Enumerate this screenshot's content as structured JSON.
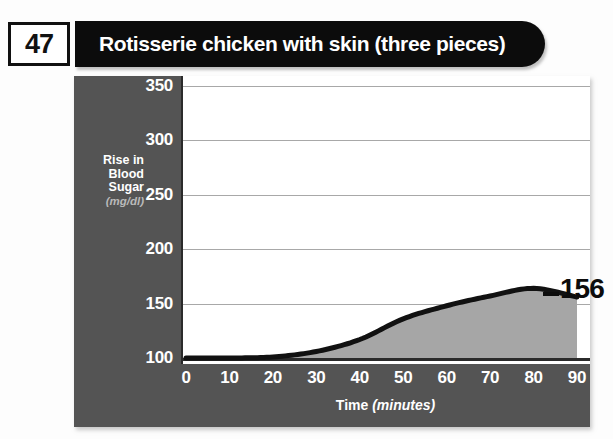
{
  "header": {
    "badge_number": "47",
    "title": "Rotisserie chicken with skin (three pieces)"
  },
  "axes": {
    "y_title_line1": "Rise in",
    "y_title_line2": "Blood",
    "y_title_line3": "Sugar",
    "y_unit": "(mg/dl)",
    "x_title": "Time",
    "x_unit": "(minutes)"
  },
  "callout": {
    "end_value": "156"
  },
  "colors": {
    "banner": "#0c0c0c",
    "panel_gray": "#545454",
    "area_fill": "#a6a6a6",
    "line": "#111111",
    "gridline": "#a8a8a8",
    "plot_background": "#ffffff"
  },
  "chart_data": {
    "type": "area",
    "title": "Rotisserie chicken with skin (three pieces)",
    "xlabel": "Time (minutes)",
    "ylabel": "Rise in Blood Sugar (mg/dl)",
    "xlim": [
      0,
      90
    ],
    "ylim": [
      100,
      350
    ],
    "xticks": [
      0,
      10,
      20,
      30,
      40,
      50,
      60,
      70,
      80,
      90
    ],
    "yticks": [
      100,
      150,
      200,
      250,
      300,
      350
    ],
    "grid": true,
    "legend": null,
    "x": [
      0,
      10,
      20,
      30,
      40,
      50,
      60,
      70,
      80,
      90
    ],
    "values": [
      100,
      100,
      101,
      106,
      117,
      136,
      148,
      157,
      164,
      156
    ],
    "annotations": [
      {
        "x": 90,
        "y": 156,
        "text": "156"
      }
    ]
  }
}
